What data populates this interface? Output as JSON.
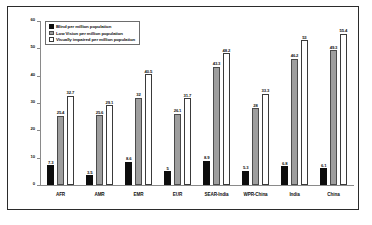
{
  "chart_data": {
    "type": "bar",
    "title": "",
    "xlabel": "",
    "ylabel": "",
    "ylim": [
      0,
      60
    ],
    "yticks": [
      0,
      10,
      20,
      30,
      40,
      50,
      60
    ],
    "grid": false,
    "legend_position": "top-left",
    "categories": [
      "AFR",
      "AMR",
      "EMR",
      "EUR",
      "SEAR-India",
      "WPR-China",
      "India",
      "China"
    ],
    "series": [
      {
        "name": "Blind per million population",
        "color": "#0d0d0d",
        "values": [
          7.3,
          3.5,
          8.6,
          5,
          8.9,
          5.3,
          6.8,
          6.1
        ],
        "labels": [
          "7.3",
          "3.5",
          "8.6",
          "5",
          "8.9",
          "5.3",
          "6.8",
          "6.1"
        ]
      },
      {
        "name": "Low Vision per million population",
        "color": "#9e9e9e",
        "values": [
          25.4,
          25.6,
          32,
          26.1,
          43.3,
          28,
          46.2,
          49.3
        ],
        "labels": [
          "25.4",
          "25.6",
          "32",
          "26.1",
          "43.3",
          "28",
          "46.2",
          "49.3"
        ]
      },
      {
        "name": "Visually impaired per million population",
        "color": "#ffffff",
        "values": [
          32.7,
          29.1,
          40.5,
          31.7,
          48.2,
          33.3,
          53,
          55.4
        ],
        "labels": [
          "32.7",
          "29.1",
          "40.5",
          "31.7",
          "48.2",
          "33.3",
          "53",
          "55.4"
        ]
      }
    ]
  },
  "legend": {
    "items": [
      {
        "label": "Blind per million population"
      },
      {
        "label": "Low Vision per million population"
      },
      {
        "label": "Visually impaired per million population"
      }
    ]
  },
  "axis": {
    "y_tick_labels": [
      "60",
      "50",
      "40",
      "30",
      "20",
      "10",
      "0"
    ]
  }
}
